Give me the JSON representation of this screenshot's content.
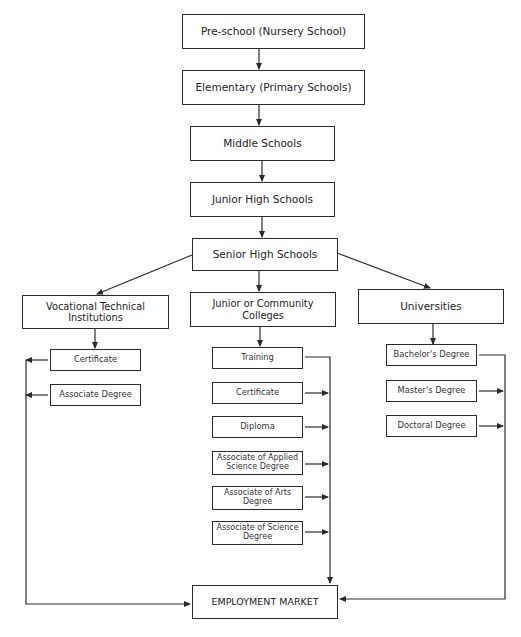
{
  "diagram": {
    "type": "flowchart",
    "levels": [
      {
        "id": "preschool",
        "label": "Pre-school (Nursery School)"
      },
      {
        "id": "elementary",
        "label": "Elementary (Primary Schools)"
      },
      {
        "id": "middle",
        "label": "Middle Schools"
      },
      {
        "id": "junior_high",
        "label": "Junior High Schools"
      },
      {
        "id": "senior_high",
        "label": "Senior High Schools"
      }
    ],
    "branches": [
      {
        "id": "vocational",
        "label": "Vocational Technical Institutions",
        "outcomes": [
          "Certificate",
          "Associate Degree"
        ]
      },
      {
        "id": "community",
        "label": "Junior or Community Colleges",
        "outcomes": [
          "Training",
          "Certificate",
          "Diploma",
          "Associate of Applied Science Degree",
          "Associate of Arts Degree",
          "Associate of Science Degree"
        ]
      },
      {
        "id": "universities",
        "label": "Universities",
        "outcomes": [
          "Bachelor's Degree",
          "Master's Degree",
          "Doctoral Degree"
        ]
      }
    ],
    "sink": {
      "id": "employment",
      "label": "EMPLOYMENT MARKET"
    },
    "colors": {
      "stroke": "#2a2a2a",
      "background": "#ffffff",
      "text": "#222222"
    }
  }
}
